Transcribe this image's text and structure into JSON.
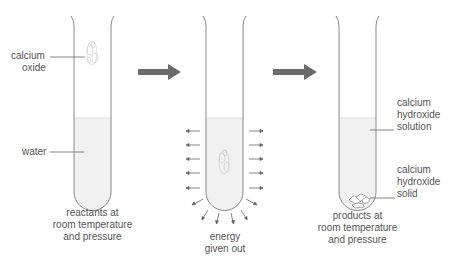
{
  "diagram": {
    "tube1": {
      "labels": {
        "calcium_oxide_1": "calcium",
        "calcium_oxide_2": "oxide",
        "water": "water"
      },
      "caption": [
        "reactants at",
        "room temperature",
        "and pressure"
      ]
    },
    "tube2": {
      "caption": [
        "energy",
        "given out"
      ]
    },
    "tube3": {
      "labels": {
        "solution_1": "calcium",
        "solution_2": "hydroxide",
        "solution_3": "solution",
        "solid_1": "calcium",
        "solid_2": "hydroxide",
        "solid_3": "solid"
      },
      "caption": [
        "products at",
        "room temperature",
        "and pressure"
      ]
    },
    "colors": {
      "arrow": "#6b6b6b",
      "tube_outline": "#8a8a8a",
      "liquid": "#f1f1f1",
      "text": "#555555"
    }
  }
}
